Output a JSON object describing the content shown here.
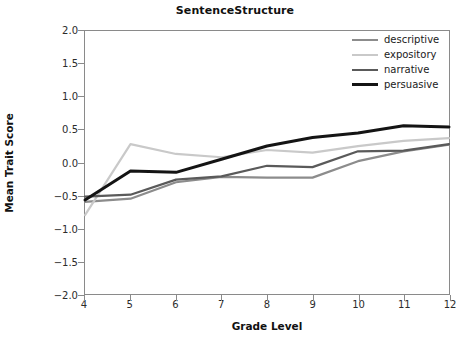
{
  "chart_data": {
    "type": "line",
    "title": "SentenceStructure",
    "xlabel": "Grade Level",
    "ylabel": "Mean Trait Score",
    "x": [
      4,
      5,
      6,
      7,
      8,
      9,
      10,
      11,
      12
    ],
    "xticklabels": [
      "4",
      "5",
      "6",
      "7",
      "8",
      "9",
      "10",
      "11",
      "12"
    ],
    "yticklabels": [
      "2.0",
      "1.5",
      "1.0",
      "0.5",
      "0.0",
      "-0.5",
      "-1.0",
      "-1.5",
      "-2.0"
    ],
    "ytickvalues": [
      2.0,
      1.5,
      1.0,
      0.5,
      0.0,
      -0.5,
      -1.0,
      -1.5,
      -2.0
    ],
    "xlim": [
      4,
      12
    ],
    "ylim": [
      -2.0,
      2.0
    ],
    "grid": false,
    "legend_position": "top-right",
    "series": [
      {
        "name": "descriptive",
        "color": "#8c8c8c",
        "width": 2.2,
        "values": [
          -0.6,
          -0.55,
          -0.3,
          -0.22,
          -0.23,
          -0.23,
          0.02,
          0.17,
          0.27
        ]
      },
      {
        "name": "expository",
        "color": "#c9c9c9",
        "width": 2.2,
        "values": [
          -0.8,
          0.28,
          0.13,
          0.08,
          0.19,
          0.15,
          0.25,
          0.33,
          0.37
        ]
      },
      {
        "name": "narrative",
        "color": "#5a5a5a",
        "width": 2.2,
        "values": [
          -0.52,
          -0.49,
          -0.26,
          -0.21,
          -0.05,
          -0.07,
          0.17,
          0.18,
          0.28
        ]
      },
      {
        "name": "persuasive",
        "color": "#141414",
        "width": 3.0,
        "values": [
          -0.57,
          -0.13,
          -0.15,
          0.05,
          0.25,
          0.38,
          0.45,
          0.56,
          0.54
        ]
      }
    ]
  }
}
